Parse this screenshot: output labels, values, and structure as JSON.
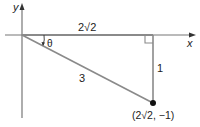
{
  "diagram": {
    "axes": {
      "x_label": "x",
      "y_label": "y"
    },
    "triangle": {
      "horizontal_leg_label": "2√2",
      "vertical_leg_label": "1",
      "hypotenuse_label": "3",
      "angle_label": "θ",
      "right_angle_marker": true
    },
    "point": {
      "label": "(2√2, −1)",
      "x": "2√2",
      "y": "−1"
    },
    "colors": {
      "lines": "#8a8a8a",
      "axis": "#777777",
      "point": "#111111",
      "text": "#222222"
    }
  }
}
